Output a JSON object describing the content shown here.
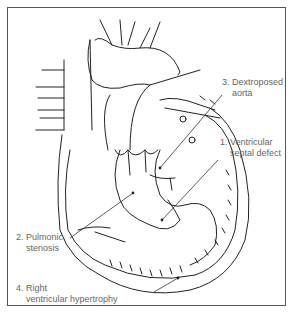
{
  "diagram": {
    "labels": [
      {
        "number": "1.",
        "line1": "Ventricular",
        "line2": "septal defect"
      },
      {
        "number": "2.",
        "line1": "Pulmonic",
        "line2": "stenosis"
      },
      {
        "number": "3.",
        "line1": "Dextroposed",
        "line2": "aorta"
      },
      {
        "number": "4.",
        "line1": "Right",
        "line2": "ventricular hypertrophy"
      }
    ]
  }
}
